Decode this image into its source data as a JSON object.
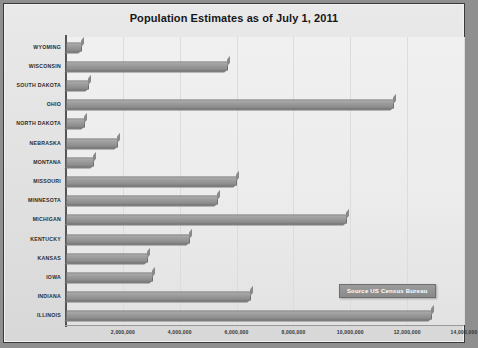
{
  "chart_data": {
    "type": "bar",
    "orientation": "horizontal",
    "title": "Population Estimates as of July 1, 2011",
    "xlabel": "",
    "ylabel": "",
    "xlim": [
      0,
      14000000
    ],
    "xticks": [
      2000000,
      4000000,
      6000000,
      8000000,
      10000000,
      12000000,
      14000000
    ],
    "xtick_labels": [
      "2,000,000",
      "4,000,000",
      "6,000,000",
      "8,000,000",
      "10,000,000",
      "12,000,000",
      "14,000,000"
    ],
    "grid": true,
    "legend": false,
    "annotation": "Source US Census Bureau",
    "categories": [
      "WYOMING",
      "WISCONSIN",
      "SOUTH DAKOTA",
      "OHIO",
      "NORTH DAKOTA",
      "NEBRASKA",
      "MONTANA",
      "MISSOURI",
      "MINNESOTA",
      "MICHIGAN",
      "KENTUCKY",
      "KANSAS",
      "IOWA",
      "INDIANA",
      "ILLINOIS"
    ],
    "values": [
      568158,
      5711767,
      824082,
      11544951,
      683932,
      1842641,
      998199,
      6010688,
      5344861,
      9876187,
      4369356,
      2871238,
      3062309,
      6516922,
      12869257
    ],
    "bar_color": "#9b9b9b",
    "bar_edge_color": "#6f6f6f",
    "plot_background": "#ececec",
    "chart_background": "#e3e3e3",
    "border_color": "#3a3a3a"
  }
}
